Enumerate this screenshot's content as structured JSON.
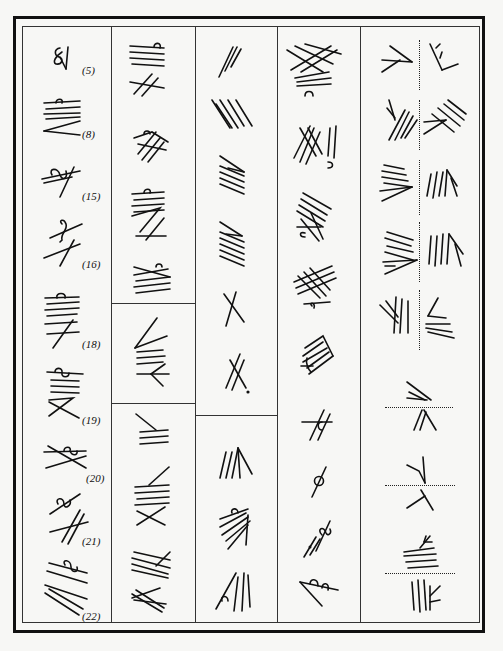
{
  "page": {
    "background_color": "#f7f7f5",
    "ink_color": "#111111"
  },
  "table": {
    "columns": 5,
    "column_1": {
      "labels": [
        "(5)",
        "(8)",
        "(15)",
        "(16)",
        "(18)",
        "(19)",
        "(20)",
        "(21)",
        "(22)"
      ],
      "sign_count": 9
    },
    "column_2": {
      "cells": 3,
      "signs_per_cell": [
        5,
        1,
        3
      ]
    },
    "column_3": {
      "cells": 2,
      "signs_per_cell": [
        6,
        3
      ]
    },
    "column_4": {
      "cells": 1,
      "signs": 9
    },
    "column_5": {
      "cells": 1,
      "pairs_vertical_divider": 5,
      "pairs_horizontal_divider": 3
    }
  }
}
